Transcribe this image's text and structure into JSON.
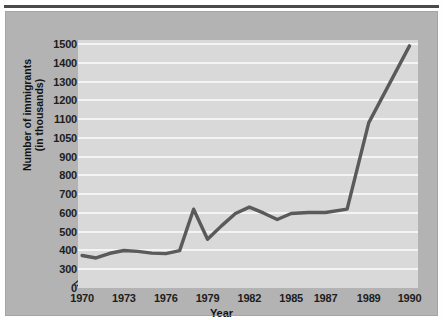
{
  "chart_data": {
    "type": "line",
    "title": "",
    "xlabel": "Year",
    "ylabel_line1": "Number of immigrants",
    "ylabel_line2": "(in thousands)",
    "x": [
      1970,
      1971,
      1972,
      1973,
      1974,
      1975,
      1976,
      1977,
      1978,
      1979,
      1980,
      1981,
      1982,
      1983,
      1984,
      1985,
      1986,
      1987,
      1988,
      1989,
      1990
    ],
    "values": [
      373,
      360,
      385,
      400,
      395,
      386,
      383,
      399,
      620,
      460,
      531,
      597,
      631,
      600,
      565,
      597,
      602,
      602,
      620,
      1090,
      1490
    ],
    "series": [
      {
        "name": "Number of immigrants (in thousands)",
        "values": [
          373,
          360,
          385,
          400,
          395,
          386,
          383,
          399,
          620,
          460,
          531,
          597,
          631,
          600,
          565,
          597,
          602,
          602,
          620,
          1090,
          1490
        ]
      }
    ],
    "xtick_labels": [
      "1970",
      "1973",
      "1976",
      "1979",
      "1982",
      "1985",
      "1987",
      "1989",
      "1990"
    ],
    "xtick_years": [
      1970,
      1973,
      1976,
      1979,
      1982,
      1985,
      1987,
      1989,
      1990
    ],
    "ytick_labels": [
      "0",
      "300",
      "400",
      "500",
      "600",
      "700",
      "800",
      "900",
      "1050",
      "1100",
      "1200",
      "1300",
      "1400",
      "1500"
    ],
    "xlim": [
      1970,
      1990
    ],
    "ylim": [
      0,
      1500
    ],
    "grid": true,
    "legend": false,
    "axis_break": true,
    "colors": {
      "line": "#5a5a5a",
      "plot_background": "#d9d9d9",
      "panel_background": "#b3b3b3",
      "gridline": "#f4f4f4",
      "text": "#1d1d1d",
      "top_rule": "#4a4a4a"
    }
  }
}
